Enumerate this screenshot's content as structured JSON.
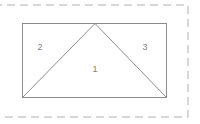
{
  "canvas": {
    "width": 200,
    "height": 124,
    "background": "#ffffff"
  },
  "selection_border": {
    "name": "dashed-selection-border",
    "color": "#b0b0b0",
    "stroke_width": 1,
    "dash": "8 5",
    "left": -6,
    "top": 5,
    "right": 188,
    "bottom": 117
  },
  "figure": {
    "name": "triangle-in-rectangle",
    "stroke_color": "#8c8c8c",
    "stroke_width": 1,
    "fill": "none",
    "rectangle": {
      "left": 22,
      "top": 23,
      "right": 167,
      "bottom": 98,
      "width": 145,
      "height": 75
    },
    "triangle": {
      "apex": {
        "x": 95,
        "y": 23
      },
      "base_left": {
        "x": 22,
        "y": 98
      },
      "base_right": {
        "x": 167,
        "y": 98
      }
    }
  },
  "labels": [
    {
      "text": "2",
      "x": 40,
      "y": 48,
      "region": "left-triangle"
    },
    {
      "text": "1",
      "x": 95,
      "y": 70,
      "region": "center-triangle"
    },
    {
      "text": "3",
      "x": 145,
      "y": 48,
      "region": "right-triangle"
    }
  ]
}
